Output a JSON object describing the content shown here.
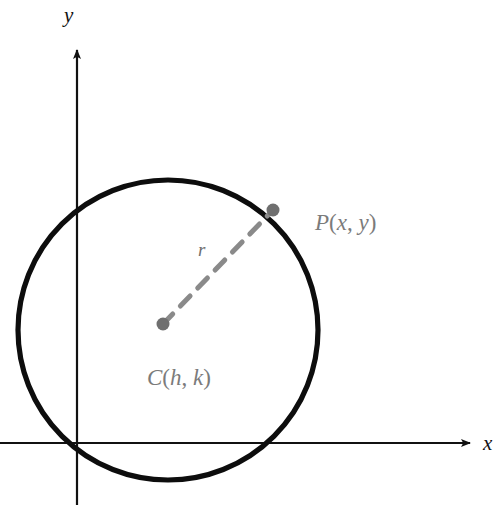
{
  "figure": {
    "background_color": "#ffffff"
  },
  "axes": {
    "x_axis": {
      "label": "x",
      "color": "#111111",
      "y_position": 443,
      "x_start": 0,
      "x_end": 478,
      "arrow": "right"
    },
    "y_axis": {
      "label": "y",
      "color": "#111111",
      "x_position": 77,
      "y_start": 505,
      "y_end": 42,
      "arrow": "up"
    }
  },
  "circle": {
    "center_x": 168,
    "center_y": 330,
    "radius": 152,
    "stroke_color": "#0d0d0d",
    "stroke_width": 5
  },
  "points": [
    {
      "name": "center-point",
      "label": "C(h, k)",
      "label_parts": {
        "letter": "C",
        "open": "(",
        "first": "h",
        "comma": ", ",
        "second": "k",
        "close": ")"
      },
      "x": 163,
      "y": 324,
      "dot_radius": 6,
      "color": "#6f6f6f"
    },
    {
      "name": "circle-point",
      "label": "P(x, y)",
      "label_parts": {
        "letter": "P",
        "open": "(",
        "first": "x",
        "comma": ", ",
        "second": "y",
        "close": ")"
      },
      "x": 273,
      "y": 210,
      "dot_radius": 6,
      "color": "#6f6f6f"
    }
  ],
  "radius_segment": {
    "label": "r",
    "from": "center-point",
    "to": "circle-point",
    "style": "dashed",
    "color": "#8a8a8a",
    "stroke_width": 5,
    "dash_pattern": "14 11"
  }
}
